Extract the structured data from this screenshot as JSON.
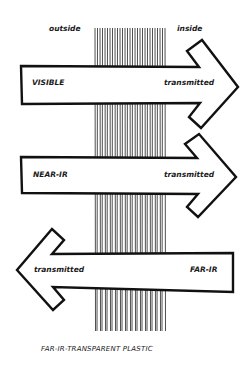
{
  "diagram": {
    "title": "FAR-IR-TRANSPARENT PLASTIC",
    "sides": {
      "outside": "outside",
      "inside": "inside"
    },
    "arrows": [
      {
        "direction": "right",
        "source_label": "VISIBLE",
        "result_label": "transmitted"
      },
      {
        "direction": "right",
        "source_label": "NEAR-IR",
        "result_label": "transmitted"
      },
      {
        "direction": "left",
        "source_label": "FAR-IR",
        "result_label": "transmitted"
      }
    ],
    "colors": {
      "ink": "#111111",
      "paper": "#ffffff"
    }
  }
}
